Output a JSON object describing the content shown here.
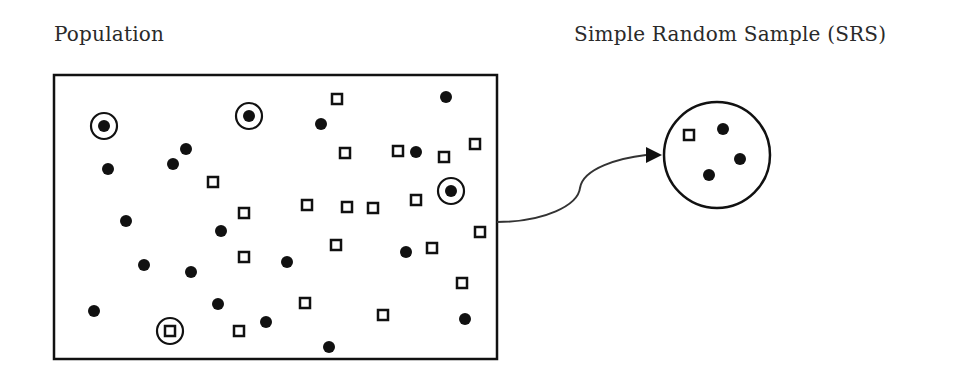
{
  "labels": {
    "population": "Population",
    "sample": "Simple Random Sample (SRS)"
  },
  "colors": {
    "ink": "#111111",
    "text": "#2a2a2a",
    "background": "#ffffff"
  },
  "population_box": {
    "x": 54,
    "y": 75,
    "width": 443,
    "height": 284
  },
  "population_items": [
    {
      "shape": "dot",
      "x": 104,
      "y": 126,
      "selected": true
    },
    {
      "shape": "dot",
      "x": 249,
      "y": 116,
      "selected": true
    },
    {
      "shape": "dot",
      "x": 451,
      "y": 191,
      "selected": true
    },
    {
      "shape": "square",
      "x": 170,
      "y": 331,
      "selected": true
    },
    {
      "shape": "dot",
      "x": 108,
      "y": 169,
      "selected": false
    },
    {
      "shape": "dot",
      "x": 186,
      "y": 149,
      "selected": false
    },
    {
      "shape": "dot",
      "x": 173,
      "y": 164,
      "selected": false
    },
    {
      "shape": "square",
      "x": 213,
      "y": 182,
      "selected": false
    },
    {
      "shape": "dot",
      "x": 126,
      "y": 221,
      "selected": false
    },
    {
      "shape": "square",
      "x": 244,
      "y": 213,
      "selected": false
    },
    {
      "shape": "dot",
      "x": 221,
      "y": 231,
      "selected": false
    },
    {
      "shape": "square",
      "x": 244,
      "y": 257,
      "selected": false
    },
    {
      "shape": "dot",
      "x": 144,
      "y": 265,
      "selected": false
    },
    {
      "shape": "dot",
      "x": 191,
      "y": 272,
      "selected": false
    },
    {
      "shape": "dot",
      "x": 287,
      "y": 262,
      "selected": false
    },
    {
      "shape": "dot",
      "x": 94,
      "y": 311,
      "selected": false
    },
    {
      "shape": "dot",
      "x": 218,
      "y": 304,
      "selected": false
    },
    {
      "shape": "square",
      "x": 239,
      "y": 331,
      "selected": false
    },
    {
      "shape": "dot",
      "x": 266,
      "y": 322,
      "selected": false
    },
    {
      "shape": "square",
      "x": 337,
      "y": 99,
      "selected": false
    },
    {
      "shape": "dot",
      "x": 446,
      "y": 97,
      "selected": false
    },
    {
      "shape": "dot",
      "x": 321,
      "y": 124,
      "selected": false
    },
    {
      "shape": "square",
      "x": 345,
      "y": 153,
      "selected": false
    },
    {
      "shape": "square",
      "x": 398,
      "y": 151,
      "selected": false
    },
    {
      "shape": "dot",
      "x": 416,
      "y": 152,
      "selected": false
    },
    {
      "shape": "square",
      "x": 444,
      "y": 157,
      "selected": false
    },
    {
      "shape": "square",
      "x": 475,
      "y": 144,
      "selected": false
    },
    {
      "shape": "square",
      "x": 307,
      "y": 205,
      "selected": false
    },
    {
      "shape": "square",
      "x": 347,
      "y": 207,
      "selected": false
    },
    {
      "shape": "square",
      "x": 373,
      "y": 208,
      "selected": false
    },
    {
      "shape": "square",
      "x": 416,
      "y": 200,
      "selected": false
    },
    {
      "shape": "square",
      "x": 480,
      "y": 232,
      "selected": false
    },
    {
      "shape": "square",
      "x": 336,
      "y": 245,
      "selected": false
    },
    {
      "shape": "dot",
      "x": 406,
      "y": 252,
      "selected": false
    },
    {
      "shape": "square",
      "x": 432,
      "y": 248,
      "selected": false
    },
    {
      "shape": "square",
      "x": 305,
      "y": 303,
      "selected": false
    },
    {
      "shape": "square",
      "x": 383,
      "y": 315,
      "selected": false
    },
    {
      "shape": "square",
      "x": 462,
      "y": 283,
      "selected": false
    },
    {
      "shape": "dot",
      "x": 465,
      "y": 319,
      "selected": false
    },
    {
      "shape": "dot",
      "x": 329,
      "y": 347,
      "selected": false
    }
  ],
  "sample_circle": {
    "cx": 717,
    "cy": 155,
    "r": 53
  },
  "sample_items": [
    {
      "shape": "square",
      "x": 689,
      "y": 135
    },
    {
      "shape": "dot",
      "x": 723,
      "y": 129
    },
    {
      "shape": "dot",
      "x": 740,
      "y": 159
    },
    {
      "shape": "dot",
      "x": 709,
      "y": 175
    }
  ],
  "arrow": {
    "path": "M 497 222 C 545 222, 578 205, 580 188 C 583 168, 620 158, 646 155",
    "head": "646,147 662,155 646,163"
  }
}
